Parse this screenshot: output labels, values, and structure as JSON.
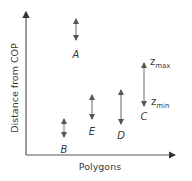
{
  "diagram": {
    "y_axis_label": "Distance from COP",
    "x_axis_label": "Polygons",
    "colors": {
      "ink": "#555555",
      "text": "#3a3a3a",
      "background": "#ffffff"
    },
    "polygons": [
      {
        "label": "A",
        "x": 76,
        "y_top": 17,
        "y_bottom": 42,
        "label_y": 58
      },
      {
        "label": "B",
        "x": 64,
        "y_top": 117,
        "y_bottom": 139,
        "label_y": 153
      },
      {
        "label": "C",
        "x": 144,
        "y_top": 61,
        "y_bottom": 108,
        "label_y": 120
      },
      {
        "label": "D",
        "x": 121,
        "y_top": 88,
        "y_bottom": 126,
        "label_y": 139
      },
      {
        "label": "E",
        "x": 92,
        "y_top": 93,
        "y_bottom": 121,
        "label_y": 135
      }
    ],
    "annotations": {
      "z_max": {
        "base": "z",
        "sub": "max"
      },
      "z_min": {
        "base": "z",
        "sub": "min"
      }
    }
  }
}
